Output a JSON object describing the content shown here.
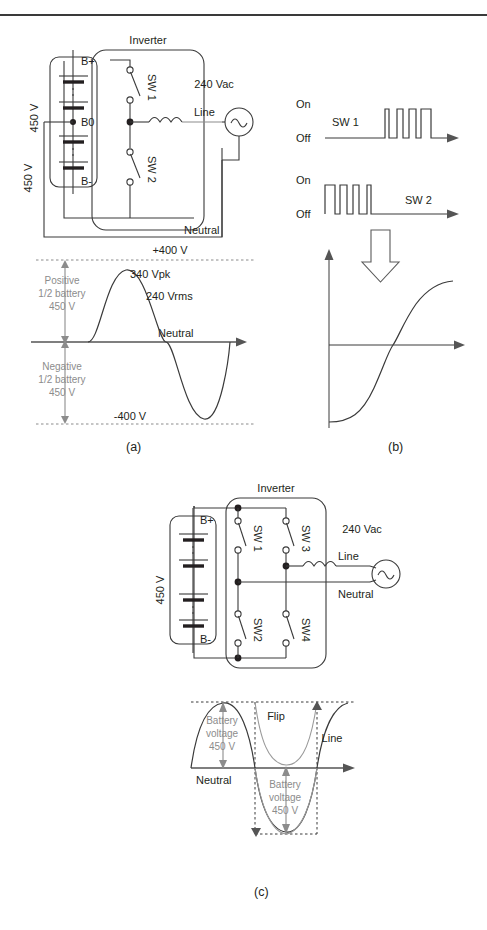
{
  "running_head": {
    "left": "",
    "right": ""
  },
  "figure": {
    "panels": [
      {
        "id": "a",
        "label": "(a)"
      },
      {
        "id": "b",
        "label": "(b)"
      },
      {
        "id": "c",
        "label": "(c)"
      }
    ]
  },
  "panel_a": {
    "circuit": {
      "title": "Inverter",
      "battery": {
        "terminal_positive": "B+",
        "terminal_mid": "B0",
        "terminal_negative": "B-",
        "upper_voltage": "450 V",
        "lower_voltage": "450 V"
      },
      "switches": [
        {
          "name": "SW 1"
        },
        {
          "name": "SW 2"
        }
      ],
      "source_label": "240 Vac",
      "line_label": "Line",
      "neutral_label": "Neutral"
    },
    "waveform": {
      "top_rail": "+400 V",
      "bottom_rail": "-400 V",
      "peak": "340 Vpk",
      "rms": "240 Vrms",
      "zero_label": "Neutral",
      "positive_annotation": "Positive\n1/2 battery\n450 V",
      "positive_annotation_lines": [
        "Positive",
        "1/2 battery",
        "450 V"
      ],
      "negative_annotation_lines": [
        "Negative",
        "1/2 battery",
        "450 V"
      ]
    }
  },
  "panel_b": {
    "traces": [
      {
        "name": "SW 1",
        "on_label": "On",
        "off_label": "Off",
        "pulse_widths": [
          3.5,
          6.0,
          7.0,
          9.5
        ],
        "pulse_pattern": "increasing-width"
      },
      {
        "name": "SW 2",
        "on_label": "On",
        "off_label": "Off",
        "pulse_widths": [
          9.5,
          7.0,
          6.0,
          3.5
        ],
        "pulse_pattern": "decreasing-width"
      }
    ],
    "arrow": "down-arrow",
    "result_curve": "s-curve"
  },
  "panel_c": {
    "circuit": {
      "title": "Inverter",
      "battery": {
        "terminal_positive": "B+",
        "terminal_negative": "B-",
        "voltage": "450 V"
      },
      "switches": [
        {
          "name": "SW 1"
        },
        {
          "name": "SW 3"
        },
        {
          "name": "SW2"
        },
        {
          "name": "SW4"
        }
      ],
      "source_label": "240 Vac",
      "line_label": "Line",
      "neutral_label": "Neutral"
    },
    "waveform": {
      "flip_label": "Flip",
      "line_label": "Line",
      "zero_label": "Neutral",
      "upper_annotation_lines": [
        "Battery",
        "voltage",
        "450 V"
      ],
      "lower_annotation_lines": [
        "Battery",
        "voltage",
        "450 V"
      ]
    }
  },
  "colors": {
    "ink": "#231f20",
    "wire": "#3a3a3a",
    "annotation_gray": "#8c8c8c",
    "axis": "#555555"
  }
}
